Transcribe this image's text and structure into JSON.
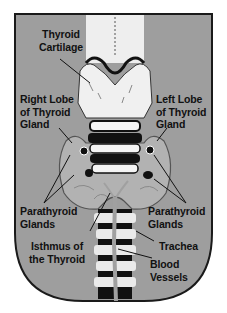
{
  "diagram": {
    "type": "anatomical-illustration",
    "colors": {
      "background": "#9e9e9e",
      "frame_border": "#1a1a1a",
      "cartilage": "#f2f2f2",
      "gland": "#a8a8a8",
      "shadow": "#111111"
    },
    "labels": {
      "thyroid_cartilage": "Thyroid\nCartilage",
      "right_lobe": "Right Lobe\nof Thyroid\nGland",
      "left_lobe": "Left Lobe\nof Thyroid\nGland",
      "parathyroid_right": "Parathyroid\nGlands",
      "parathyroid_left": "Parathyroid\nGlands",
      "isthmus": "Isthmus of\nthe Thyroid",
      "trachea": "Trachea",
      "blood_vessels": "Blood\nVessels"
    }
  }
}
